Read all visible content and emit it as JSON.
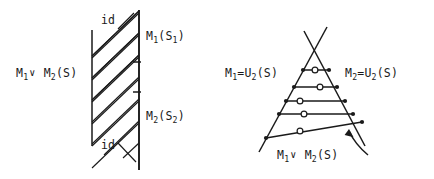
{
  "figure": {
    "background_color": "#ffffff",
    "ink_color": "#1a1a1a",
    "width": 434,
    "height": 179,
    "kind": "two-panel-hand-drawn-math-diagram"
  },
  "left_diagram": {
    "name": "braided-strands-between-two-vertical-lines",
    "labels": {
      "left_side": "M₁∨ M₂(S)",
      "top_right": "M₁(S₁)",
      "bottom_right": "M₂(S₂)",
      "top_inner": "id",
      "bottom_inner": "id"
    },
    "label_parts": {
      "left_side_base_a": "M",
      "left_side_sub_a": "1",
      "left_side_op": "∨",
      "left_side_base_b": "M",
      "left_side_sub_b": "2",
      "left_side_arg": "(S)",
      "top_right_base": "M",
      "top_right_sub": "1",
      "top_right_arg_open": "(S",
      "top_right_arg_sub": "1",
      "top_right_arg_close": ")",
      "bottom_right_base": "M",
      "bottom_right_sub": "2",
      "bottom_right_arg_open": "(S",
      "bottom_right_arg_sub": "2",
      "bottom_right_arg_close": ")",
      "id_top": "id",
      "id_bottom": "id"
    },
    "geometry": {
      "left_vertical": {
        "x": 92,
        "y1": 30,
        "y2": 146
      },
      "right_vertical": {
        "x": 139,
        "y1": 10,
        "y2": 170
      },
      "down_strand_count": 6,
      "up_strand_count": 6
    }
  },
  "right_diagram": {
    "name": "crossed-cone-with-ladder-rungs",
    "labels": {
      "left_side": "M₁=U₂(S)",
      "right_side": "M₂=U₂(S)",
      "bottom": "M₁∨ M₂(S)"
    },
    "label_parts": {
      "left_base": "M",
      "left_sub": "1",
      "left_eq": "=",
      "left_u": "U",
      "left_u_sub": "2",
      "left_arg": "(S)",
      "right_base": "M",
      "right_sub": "2",
      "right_eq": "=",
      "right_u": "U",
      "right_u_sub": "2",
      "right_arg": "(S)",
      "bottom_base_a": "M",
      "bottom_sub_a": "1",
      "bottom_op": "∨",
      "bottom_base_b": "M",
      "bottom_sub_b": "2",
      "bottom_arg": "(S)"
    },
    "geometry": {
      "rung_count": 5,
      "ring_count": 5,
      "has_curved_arrow": true,
      "arrow_direction": "up-left"
    }
  }
}
